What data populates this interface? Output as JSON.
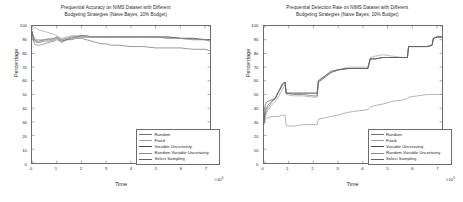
{
  "figure": {
    "background": "#ffffff",
    "axis_color": "#6d6d6d",
    "text_color": "#2a2a2a"
  },
  "panels": [
    {
      "id": "accuracy",
      "title": "Prequential Accuracy on NIMS Dataset with Different\nBudgeting Strategies (Naive Bayes, 10% Budget)",
      "xlabel": "Time",
      "ylabel": "Percentage",
      "x_multiplier": "×10",
      "x_multiplier_exp": "5"
    },
    {
      "id": "detection",
      "title": "Prequential Detection Rate on NIMS Dataset with Different\nBudgeting Strategies (Naive Bayes, 10% Budget)",
      "xlabel": "Time",
      "ylabel": "Percentage",
      "x_multiplier": "×10",
      "x_multiplier_exp": "5"
    }
  ],
  "ticks": {
    "y": [
      "100",
      "90",
      "80",
      "70",
      "60",
      "50",
      "40",
      "30",
      "20",
      "10",
      "0"
    ],
    "x": [
      "0",
      "1",
      "2",
      "3",
      "4",
      "5",
      "6",
      "7"
    ]
  },
  "legend": {
    "entries": [
      {
        "label": "Random",
        "color": "#707070"
      },
      {
        "label": "Fixed",
        "color": "#9a9a9a"
      },
      {
        "label": "Variable Uncertainty",
        "color": "#4a4a4a"
      },
      {
        "label": "Random Variable Uncertainty",
        "color": "#8d8d8d"
      },
      {
        "label": "Select Sampling",
        "color": "#606060"
      }
    ]
  },
  "chart_data": [
    {
      "type": "line",
      "title": "Prequential Accuracy on NIMS Dataset with Different Budgeting Strategies (Naive Bayes, 10% Budget)",
      "xlabel": "Time",
      "ylabel": "Percentage",
      "xlim": [
        0,
        7.2
      ],
      "ylim": [
        0,
        100
      ],
      "x_multiplier": 100000,
      "grid": false,
      "legend_position": "lower-right",
      "x": [
        0,
        0.05,
        0.1,
        0.2,
        0.3,
        0.5,
        0.7,
        0.9,
        1.0,
        1.1,
        1.2,
        1.4,
        1.6,
        1.8,
        2.0,
        2.2,
        2.4,
        2.6,
        2.8,
        3.0,
        3.2,
        3.5,
        4.0,
        4.5,
        5.0,
        5.5,
        6.0,
        6.5,
        7.0,
        7.2
      ],
      "series": [
        {
          "name": "Random",
          "color": "#707070",
          "values": [
            96,
            90,
            87,
            86,
            86,
            87,
            88,
            89,
            90,
            89,
            88,
            90,
            91,
            92,
            92,
            92,
            92,
            92,
            92,
            92,
            92,
            92,
            92,
            92,
            92,
            92,
            91,
            91,
            90,
            90
          ]
        },
        {
          "name": "Fixed",
          "color": "#9a9a9a",
          "values": [
            97,
            98,
            99,
            98,
            97,
            96,
            95,
            94,
            93,
            92,
            91,
            92,
            93,
            93,
            93,
            92,
            92,
            92,
            92,
            92,
            92,
            92,
            92,
            92,
            92,
            91,
            91,
            90,
            90,
            89
          ]
        },
        {
          "name": "Variable Uncertainty",
          "color": "#4a4a4a",
          "values": [
            95,
            92,
            90,
            89,
            89,
            90,
            90,
            91,
            92,
            91,
            90,
            91,
            92,
            92,
            93,
            93,
            92,
            92,
            92,
            92,
            92,
            92,
            92,
            92,
            92,
            92,
            91,
            91,
            90,
            90
          ]
        },
        {
          "name": "Random Variable Uncertainty",
          "color": "#8d8d8d",
          "values": [
            96,
            93,
            91,
            90,
            90,
            90,
            91,
            91,
            92,
            90,
            89,
            90,
            91,
            92,
            92,
            92,
            92,
            92,
            92,
            92,
            92,
            92,
            92,
            92,
            92,
            91,
            91,
            90,
            90,
            89
          ]
        },
        {
          "name": "Select Sampling",
          "color": "#606060",
          "values": [
            96,
            91,
            89,
            88,
            88,
            89,
            89,
            90,
            91,
            90,
            89,
            90,
            90,
            91,
            91,
            90,
            89,
            88,
            87,
            87,
            86,
            86,
            85,
            85,
            84,
            84,
            84,
            83,
            83,
            82
          ]
        }
      ]
    },
    {
      "type": "line",
      "title": "Prequential Detection Rate on NIMS Dataset with Different Budgeting Strategies (Naive Bayes, 10% Budget)",
      "xlabel": "Time",
      "ylabel": "Percentage",
      "xlim": [
        0,
        7.2
      ],
      "ylim": [
        0,
        100
      ],
      "x_multiplier": 100000,
      "grid": false,
      "legend_position": "lower-right",
      "x": [
        0,
        0.05,
        0.15,
        0.3,
        0.45,
        0.6,
        0.75,
        0.85,
        0.9,
        1.2,
        1.6,
        2.0,
        2.15,
        2.2,
        2.5,
        2.7,
        3.0,
        3.4,
        3.8,
        4.2,
        4.3,
        4.5,
        4.8,
        5.2,
        5.6,
        5.8,
        5.85,
        6.2,
        6.6,
        6.8,
        6.85,
        7.0,
        7.2
      ],
      "series": [
        {
          "name": "Random",
          "color": "#707070",
          "values": [
            30,
            36,
            40,
            44,
            47,
            52,
            57,
            59,
            51,
            51,
            51,
            51,
            51,
            60,
            64,
            66,
            68,
            69,
            69,
            69,
            76,
            76,
            77,
            77,
            77,
            77,
            85,
            85,
            85,
            86,
            91,
            92,
            92
          ]
        },
        {
          "name": "Fixed",
          "color": "#9a9a9a",
          "values": [
            29,
            34,
            38,
            42,
            45,
            49,
            54,
            57,
            50,
            49,
            49,
            48,
            48,
            59,
            63,
            66,
            68,
            70,
            70,
            70,
            77,
            78,
            79,
            78,
            77,
            77,
            85,
            85,
            85,
            86,
            91,
            92,
            92
          ]
        },
        {
          "name": "Variable Uncertainty",
          "color": "#4a4a4a",
          "values": [
            31,
            43,
            45,
            46,
            47,
            53,
            58,
            59,
            51,
            51,
            51,
            51,
            51,
            60,
            64,
            67,
            68,
            69,
            69,
            69,
            76,
            76,
            77,
            77,
            77,
            77,
            85,
            85,
            85,
            86,
            91,
            92,
            92
          ]
        },
        {
          "name": "Random Variable Uncertainty",
          "color": "#8d8d8d",
          "values": [
            28,
            32,
            33,
            34,
            34,
            34,
            35,
            35,
            27,
            27,
            28,
            28,
            28,
            32,
            33,
            34,
            35,
            37,
            38,
            39,
            41,
            42,
            43,
            45,
            46,
            47,
            48,
            49,
            50,
            50,
            50,
            50,
            50
          ]
        },
        {
          "name": "Select Sampling",
          "color": "#606060",
          "values": [
            30,
            38,
            42,
            45,
            47,
            52,
            57,
            59,
            51,
            50,
            50,
            49,
            49,
            59,
            63,
            66,
            68,
            69,
            69,
            69,
            76,
            76,
            77,
            77,
            77,
            77,
            85,
            85,
            85,
            86,
            91,
            92,
            92
          ]
        }
      ]
    }
  ]
}
